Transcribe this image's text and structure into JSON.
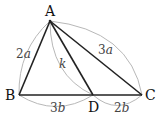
{
  "diagram": {
    "type": "triangle",
    "points": {
      "A": {
        "label": "A"
      },
      "B": {
        "label": "B"
      },
      "C": {
        "label": "C"
      },
      "D": {
        "label": "D"
      }
    },
    "lengths": {
      "AB": {
        "coef": "2",
        "var": "a"
      },
      "AC": {
        "coef": "3",
        "var": "a"
      },
      "AD": {
        "coef": "",
        "var": "k"
      },
      "BD": {
        "coef": "3",
        "var": "b"
      },
      "DC": {
        "coef": "2",
        "var": "b"
      }
    },
    "colors": {
      "segment": "#222222",
      "arc": "#b0b0b0"
    }
  }
}
